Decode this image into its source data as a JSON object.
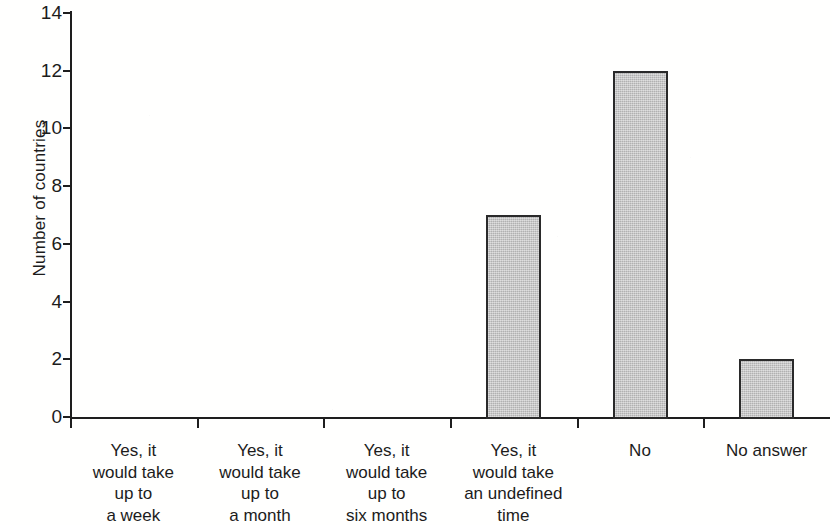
{
  "chart_data": {
    "type": "bar",
    "title": "",
    "subtitle": "",
    "xlabel": "",
    "ylabel": "Number of countries",
    "categories": [
      "Yes, it\nwould take\nup to\na week",
      "Yes, it\nwould take\nup to\na month",
      "Yes, it\nwould take\nup to\nsix months",
      "Yes, it\nwould take\nan undefined\ntime",
      "No",
      "No answer"
    ],
    "values": [
      0,
      0,
      0,
      7,
      12,
      2
    ],
    "ylim": [
      0,
      14
    ],
    "ytick_labels": [
      "0",
      "2",
      "4",
      "6",
      "8",
      "10",
      "12",
      "14"
    ],
    "ytick_values": [
      0,
      2,
      4,
      6,
      8,
      10,
      12,
      14
    ],
    "grid": false,
    "legend": false,
    "legend_position": "none",
    "bar_fill_color": "#c3c3c3",
    "bar_border_color": "#2a2a2a",
    "axis_color": "#1e1e1e",
    "text_color": "#1c1c1c",
    "background_color": "#ffffff"
  }
}
